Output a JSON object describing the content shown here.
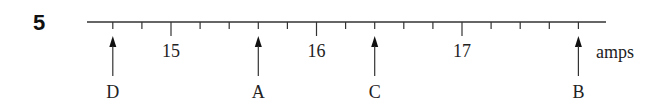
{
  "question_number": "5",
  "scale": {
    "unit_label": "amps",
    "major_labels": [
      "15",
      "16",
      "17"
    ],
    "major_values": [
      15,
      16,
      17
    ],
    "minor_step": 0.2,
    "range": [
      14.4,
      17.9
    ]
  },
  "pointers": [
    {
      "label": "D",
      "value": 14.6
    },
    {
      "label": "A",
      "value": 15.6
    },
    {
      "label": "C",
      "value": 16.4
    },
    {
      "label": "B",
      "value": 17.8
    }
  ]
}
